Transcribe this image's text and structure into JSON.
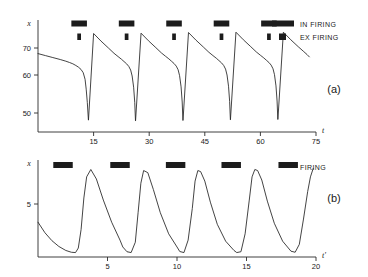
{
  "figure": {
    "background": "#ffffff",
    "ink_color": "#222222"
  },
  "panels": [
    {
      "id": "a",
      "label": "(a)",
      "y_axis_name": "x",
      "x_axis_name": "t",
      "y_ticks": [
        "70",
        "60",
        "50"
      ],
      "x_ticks": [
        "15",
        "30",
        "45",
        "60",
        "75"
      ],
      "legend": [
        {
          "label": "IN FIRING",
          "marker": "wide-bar"
        },
        {
          "label": "EX FIRING",
          "marker": "small-square"
        }
      ]
    },
    {
      "id": "b",
      "label": "(b)",
      "y_axis_name": "x",
      "x_axis_name": "t'",
      "y_ticks": [
        "5"
      ],
      "x_ticks": [
        "5",
        "10",
        "15",
        "20"
      ],
      "legend": [
        {
          "label": "FIRING",
          "marker": "wide-bar"
        }
      ]
    }
  ],
  "chart_data": [
    {
      "type": "line",
      "panel": "a",
      "title": "",
      "xlabel": "t",
      "ylabel": "x",
      "xlim": [
        0,
        75
      ],
      "ylim": [
        42,
        76
      ],
      "x_ticks": [
        15,
        30,
        45,
        60,
        75
      ],
      "y_ticks": [
        70,
        60,
        50
      ],
      "grid": false,
      "legend_position": "top-right",
      "series": [
        {
          "name": "x(t)",
          "comment": "relaxation oscillation: slow concave decay, sharp V-dip to minimum, vertical jump up",
          "x": [
            0,
            2.0,
            4.0,
            6.0,
            7.5,
            8.5,
            9.4,
            10.2,
            10.9,
            11.6,
            12.2,
            12.7,
            13.0,
            13.3,
            13.6,
            13.62,
            15.0,
            17.0,
            19.0,
            20.5,
            21.6,
            22.5,
            23.2,
            23.9,
            24.5,
            25.0,
            25.4,
            25.8,
            26.1,
            26.3,
            26.32,
            27.8,
            29.8,
            31.8,
            33.3,
            34.4,
            35.3,
            36.0,
            36.7,
            37.3,
            37.8,
            38.2,
            38.6,
            38.9,
            39.1,
            39.12,
            40.6,
            42.6,
            44.6,
            46.1,
            47.2,
            48.1,
            48.8,
            49.5,
            50.1,
            50.6,
            51.0,
            51.4,
            51.7,
            51.9,
            51.92,
            53.4,
            55.4,
            57.4,
            58.9,
            60.0,
            60.9,
            61.6,
            62.3,
            62.9,
            63.4,
            63.8,
            64.2,
            64.5,
            64.7,
            64.72,
            66.2,
            68.2,
            70.2,
            71.7,
            72.6,
            73.2
          ],
          "y": [
            65.8,
            65.2,
            64.6,
            64.0,
            63.5,
            63.1,
            62.7,
            62.2,
            61.7,
            61.0,
            60.0,
            58.0,
            55.0,
            51.0,
            45.6,
            45.6,
            71.9,
            69.6,
            67.5,
            65.9,
            64.9,
            64.1,
            63.4,
            62.7,
            61.9,
            60.8,
            59.0,
            55.6,
            51.0,
            45.4,
            45.4,
            72.0,
            69.7,
            67.6,
            66.0,
            65.0,
            64.2,
            63.5,
            62.8,
            62.0,
            60.9,
            59.1,
            55.7,
            51.1,
            45.5,
            45.5,
            72.2,
            69.9,
            67.8,
            66.2,
            65.2,
            64.4,
            63.7,
            63.0,
            62.2,
            61.1,
            59.3,
            55.9,
            51.3,
            45.7,
            45.7,
            72.3,
            70.0,
            67.9,
            66.3,
            65.3,
            64.5,
            63.8,
            63.1,
            62.3,
            61.2,
            59.4,
            56.0,
            51.4,
            45.8,
            45.8,
            72.3,
            70.0,
            67.9,
            66.4,
            65.5,
            64.8
          ],
          "y_start": 65.8
        }
      ],
      "event_bars": {
        "in_firing": [
          {
            "start": 9.0,
            "end": 13.2
          },
          {
            "start": 21.8,
            "end": 26.0
          },
          {
            "start": 34.6,
            "end": 38.8
          },
          {
            "start": 47.4,
            "end": 51.6
          },
          {
            "start": 60.2,
            "end": 64.4
          }
        ],
        "ex_firing": [
          {
            "start": 10.6,
            "end": 11.6
          },
          {
            "start": 23.4,
            "end": 24.4
          },
          {
            "start": 36.2,
            "end": 37.2
          },
          {
            "start": 49.0,
            "end": 50.0
          },
          {
            "start": 61.8,
            "end": 62.8
          }
        ]
      }
    },
    {
      "type": "line",
      "panel": "b",
      "title": "",
      "xlabel": "t'",
      "ylabel": "x",
      "xlim": [
        0,
        20
      ],
      "ylim": [
        0,
        9.2
      ],
      "x_ticks": [
        5,
        10,
        15,
        20
      ],
      "y_ticks": [
        5
      ],
      "grid": false,
      "legend_position": "top-right",
      "series": [
        {
          "name": "x(t')",
          "comment": "spike train: fast rise to peak ~8.3 then exponential decay to ~0.4, period ~4.1",
          "x": [
            0.0,
            0.5,
            1.0,
            1.5,
            2.0,
            2.4,
            2.7,
            2.9,
            3.1,
            3.3,
            3.5,
            3.8,
            4.2,
            4.7,
            5.3,
            5.9,
            6.1,
            6.4,
            6.7,
            7.0,
            7.2,
            7.4,
            7.6,
            7.9,
            8.3,
            8.8,
            9.4,
            10.0,
            10.2,
            10.5,
            10.8,
            11.1,
            11.3,
            11.5,
            11.7,
            12.0,
            12.4,
            12.9,
            13.5,
            14.1,
            14.3,
            14.6,
            14.9,
            15.2,
            15.4,
            15.6,
            15.8,
            16.1,
            16.5,
            17.0,
            17.6,
            18.2,
            18.5,
            18.8,
            19.1,
            19.4,
            19.6,
            19.8
          ],
          "y": [
            3.3,
            2.3,
            1.55,
            1.0,
            0.62,
            0.45,
            0.42,
            0.85,
            2.6,
            5.6,
            7.6,
            8.3,
            7.4,
            5.4,
            3.3,
            1.6,
            0.95,
            0.5,
            0.42,
            1.4,
            4.2,
            7.0,
            8.2,
            8.0,
            6.4,
            4.2,
            2.2,
            0.95,
            0.52,
            0.42,
            1.6,
            4.6,
            7.2,
            8.2,
            8.1,
            7.2,
            5.2,
            3.1,
            1.5,
            0.62,
            0.42,
            0.5,
            2.2,
            5.4,
            7.6,
            8.3,
            8.2,
            7.3,
            5.3,
            3.2,
            1.5,
            0.55,
            0.45,
            1.2,
            3.6,
            6.2,
            7.6,
            8.4
          ]
        }
      ],
      "event_bars": {
        "firing": [
          {
            "start": 1.1,
            "end": 2.5
          },
          {
            "start": 5.2,
            "end": 6.6
          },
          {
            "start": 9.2,
            "end": 10.6
          },
          {
            "start": 13.2,
            "end": 14.6
          },
          {
            "start": 17.3,
            "end": 18.7
          }
        ]
      }
    }
  ]
}
